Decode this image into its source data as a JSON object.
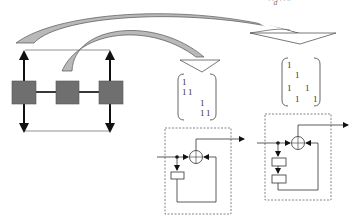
{
  "figure": {
    "top_caption_fragment": "' 'd  ' ' ''",
    "colors": {
      "node_fill": "#6f6f6f",
      "node_stroke": "#555555",
      "arrow_fill_gray": "#b9b9b9",
      "arrow_stroke": "#555555",
      "line": "#222222",
      "dashed": "#666666"
    },
    "network": {
      "nodes": [
        "node-left",
        "node-center",
        "node-right"
      ],
      "description": "three gray blocks connected in a chain with vertical bidirectional arrows on outer nodes"
    },
    "matrices": [
      {
        "name": "matrix-1",
        "rows": [
          [
            "1",
            "",
            "",
            ""
          ],
          [
            "1",
            "1",
            "",
            ""
          ],
          [
            "",
            "",
            "1",
            ""
          ],
          [
            "",
            "",
            "1",
            "1"
          ]
        ]
      },
      {
        "name": "matrix-2",
        "rows": [
          [
            "1",
            "",
            "",
            ""
          ],
          [
            "",
            "1",
            "",
            ""
          ],
          [
            "1",
            "",
            "1",
            ""
          ],
          [
            "",
            "1",
            "",
            "1"
          ]
        ]
      }
    ],
    "blocks": [
      {
        "name": "block-diagram-1",
        "delay_boxes": 1
      },
      {
        "name": "block-diagram-2",
        "delay_boxes": 2
      }
    ]
  }
}
